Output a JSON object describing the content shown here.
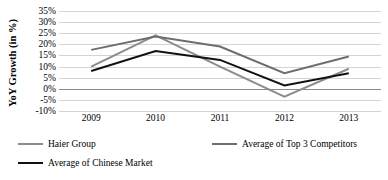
{
  "chart_data": {
    "type": "line",
    "title": "",
    "xlabel": "",
    "ylabel": "YoY Growth (in %)",
    "categories": [
      "2009",
      "2010",
      "2011",
      "2012",
      "2013"
    ],
    "x": [
      2009,
      2010,
      2011,
      2012,
      2013
    ],
    "ylim": [
      -10,
      35
    ],
    "ytick_labels": [
      "35%",
      "30%",
      "25%",
      "20%",
      "15%",
      "10%",
      "5%",
      "0%",
      "-5%",
      "-10%"
    ],
    "ytick_values": [
      35,
      30,
      25,
      20,
      15,
      10,
      5,
      0,
      -5,
      -10
    ],
    "grid": true,
    "legend_position": "bottom-left",
    "series": [
      {
        "name": "Haier Group",
        "color": "#8c8c8c",
        "values": [
          10,
          24,
          10,
          -3.5,
          9
        ]
      },
      {
        "name": "Average of Top 3 Competitors",
        "color": "#6e6e6e",
        "values": [
          17.5,
          23.5,
          19,
          7,
          14.5
        ]
      },
      {
        "name": "Average of Chinese Market",
        "color": "#111111",
        "values": [
          8,
          17,
          13,
          1.5,
          7
        ]
      }
    ]
  },
  "axis": {
    "y_title": "YoY Growth (in %)"
  },
  "legend": {
    "items": [
      {
        "label": "Haier Group",
        "color": "#8c8c8c"
      },
      {
        "label": "Average of Top 3 Competitors",
        "color": "#6e6e6e"
      },
      {
        "label": "Average of Chinese Market",
        "color": "#111111"
      }
    ]
  }
}
